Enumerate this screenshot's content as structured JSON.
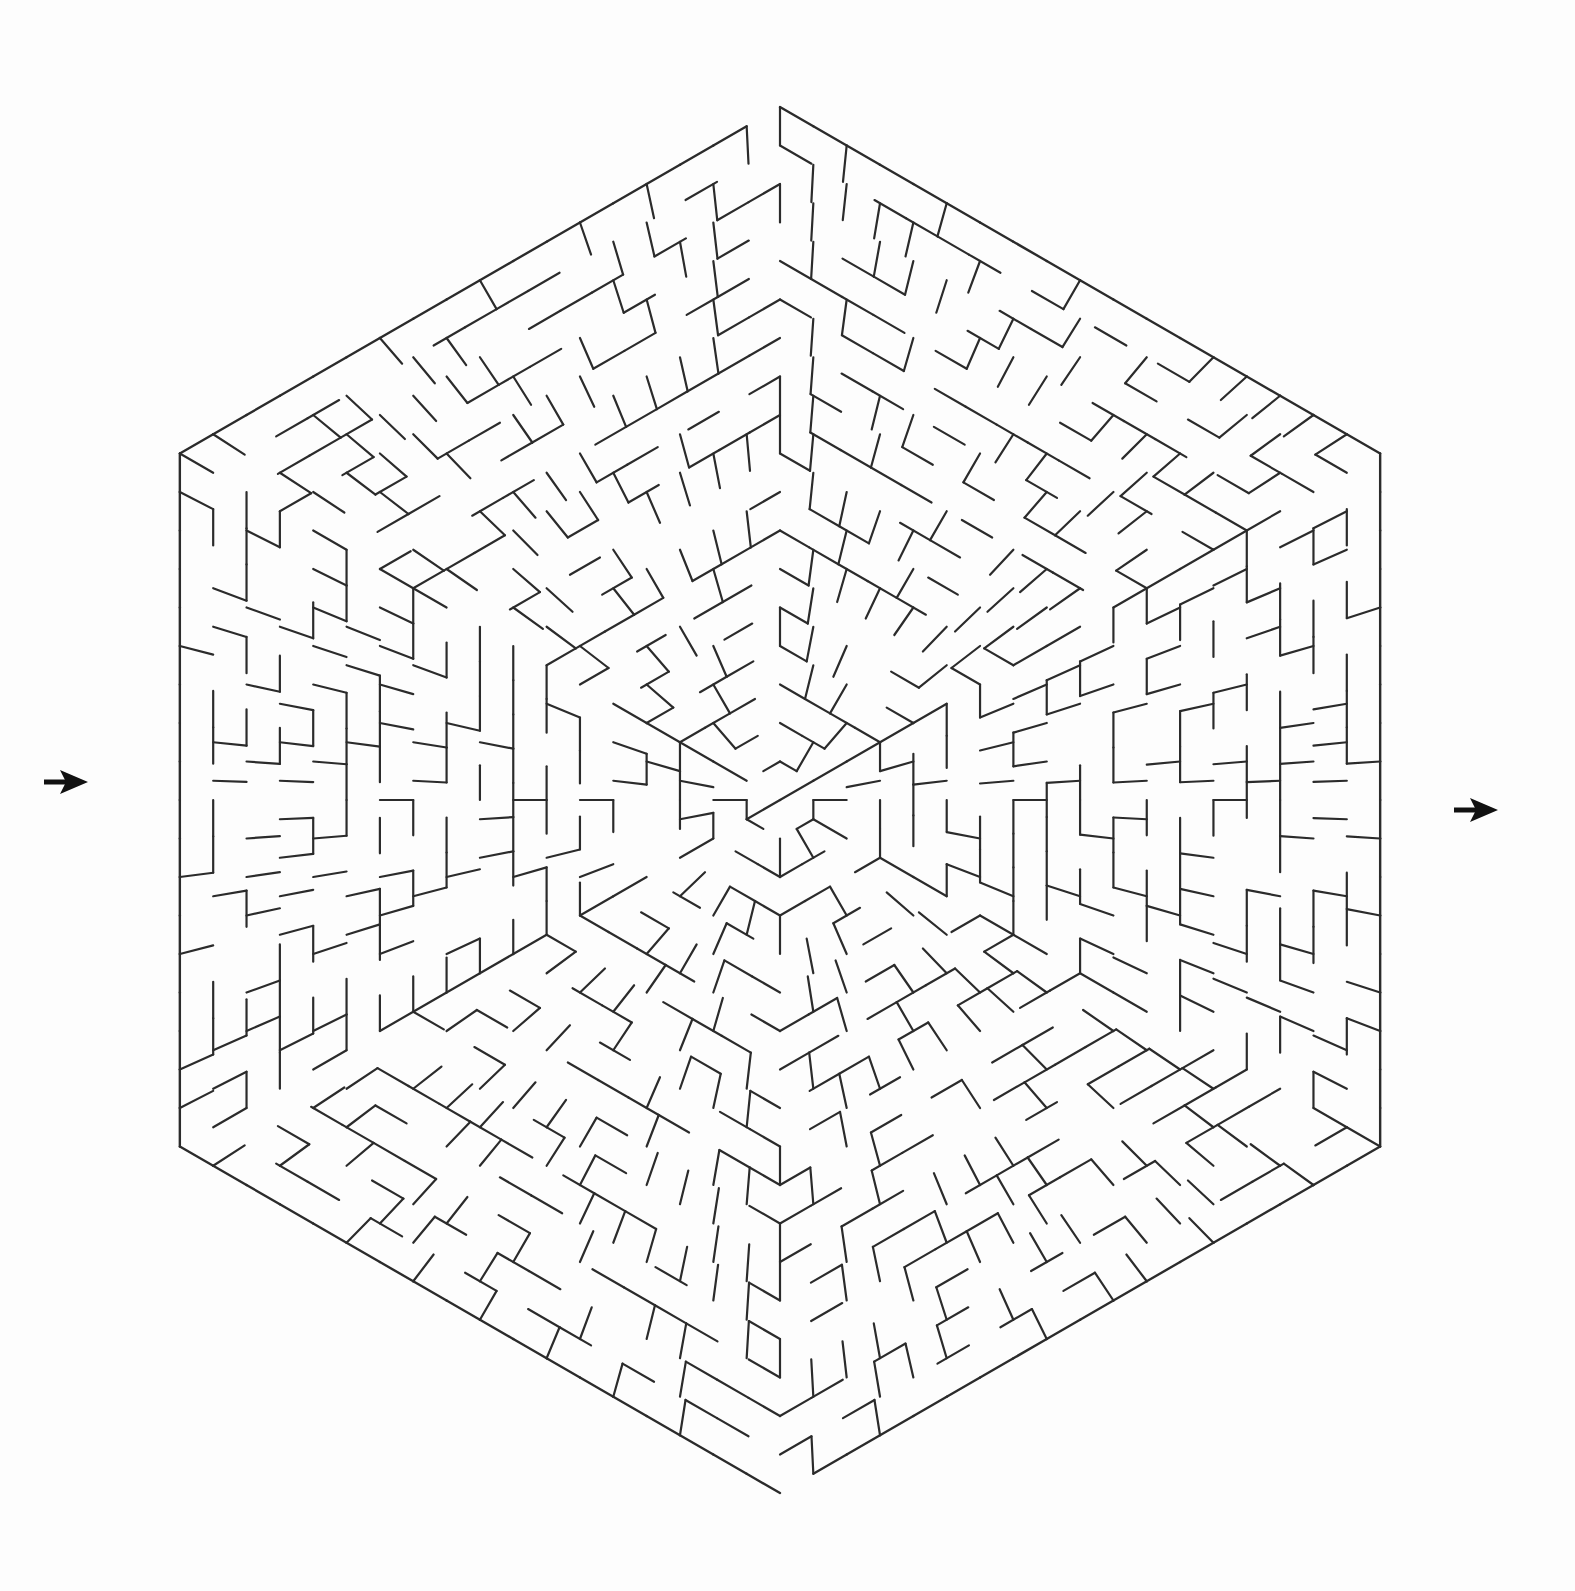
{
  "document": {
    "title": "Hexagonal Maze Puzzle",
    "kind": "printable-maze",
    "background_color": "#fdfdfd",
    "canvas_width": 1575,
    "canvas_height": 1591
  },
  "maze": {
    "shape": "hexagon",
    "orientation": "pointy-top-and-bottom",
    "style": "concentric-rings-with-radial-walls",
    "wall_color": "#2b2b2b",
    "wall_thickness_px": 2.2,
    "center": {
      "x": 780,
      "y": 800
    },
    "outer_radius_px": 707,
    "ring_count": 18,
    "ring_spacing_px": 38.5,
    "sectors": 6,
    "cells_per_sector_outer_ring": 18,
    "random_seed": 20240617,
    "vertices": [
      {
        "name": "top",
        "x": 780,
        "y": 122
      },
      {
        "name": "upper-right",
        "x": 1285,
        "y": 327
      },
      {
        "name": "lower-right",
        "x": 1487,
        "y": 808
      },
      {
        "name": "bottom",
        "x": 780,
        "y": 1497
      },
      {
        "name": "lower-left",
        "x": 273,
        "y": 1292
      },
      {
        "name": "upper-left",
        "x": 280,
        "y": 325
      }
    ]
  },
  "entrance": {
    "label": "Entrance",
    "side": "left",
    "arrow_tip_x": 88,
    "arrow_tip_y": 782,
    "arrow_direction": "right",
    "arrow_color": "#111111",
    "gap_radius_index": 18
  },
  "exit": {
    "label": "Exit",
    "side": "right",
    "arrow_tip_x": 1498,
    "arrow_tip_y": 810,
    "arrow_direction": "right",
    "arrow_color": "#111111",
    "gap_radius_index": 18
  },
  "chart_data": {
    "type": "table",
    "title": "Hexagonal Maze Puzzle",
    "xlabel": "",
    "ylabel": "",
    "categories": [
      "rings",
      "sectors",
      "cells_outer_ring",
      "entrances",
      "exits"
    ],
    "values": [
      18,
      6,
      108,
      1,
      1
    ]
  }
}
